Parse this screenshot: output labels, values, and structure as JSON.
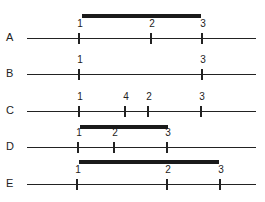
{
  "diagram": {
    "type": "linkage-order-comparison",
    "rows": [
      {
        "label": "A",
        "line_y": 38,
        "ticks": [
          {
            "label": "1",
            "x": 79
          },
          {
            "label": "2",
            "x": 151
          },
          {
            "label": "3",
            "x": 202
          }
        ],
        "bar": {
          "x1": 82,
          "x2": 201,
          "y": 16
        }
      },
      {
        "label": "B",
        "line_y": 74,
        "ticks": [
          {
            "label": "1",
            "x": 79
          },
          {
            "label": "3",
            "x": 202
          }
        ],
        "bar": null
      },
      {
        "label": "C",
        "line_y": 111,
        "ticks": [
          {
            "label": "1",
            "x": 79
          },
          {
            "label": "4",
            "x": 125
          },
          {
            "label": "2",
            "x": 148
          },
          {
            "label": "3",
            "x": 201
          }
        ],
        "bar": null
      },
      {
        "label": "D",
        "line_y": 147,
        "ticks": [
          {
            "label": "1",
            "x": 78
          },
          {
            "label": "2",
            "x": 114
          },
          {
            "label": "3",
            "x": 167
          }
        ],
        "bar": {
          "x1": 80,
          "x2": 168,
          "y": 127
        }
      },
      {
        "label": "E",
        "line_y": 184,
        "ticks": [
          {
            "label": "1",
            "x": 77
          },
          {
            "label": "2",
            "x": 167
          },
          {
            "label": "3",
            "x": 220
          }
        ],
        "bar": {
          "x1": 79,
          "x2": 219,
          "y": 162
        }
      }
    ]
  }
}
